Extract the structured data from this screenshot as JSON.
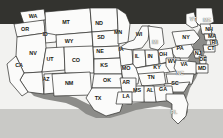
{
  "image": {
    "title": "Map of the United States with state abbreviations",
    "width": 223,
    "height": 138
  },
  "palette": {
    "sky_band": "#33332f",
    "land_fill": "#fbfbfa",
    "border_stroke": "#2b2b28",
    "ocean_shadow": "#8e8e8b",
    "foreground_band": "#c9c9c6"
  },
  "map": {
    "name": "united-states-map",
    "region_count": 49,
    "states": [
      {
        "code": "WA",
        "name": "Washington",
        "x": 33,
        "y": 17,
        "light": false
      },
      {
        "code": "OR",
        "name": "Oregon",
        "x": 25,
        "y": 30,
        "light": false
      },
      {
        "code": "ID",
        "name": "Idaho",
        "x": 45,
        "y": 35,
        "light": false
      },
      {
        "code": "MT",
        "name": "Montana",
        "x": 66,
        "y": 23,
        "light": false
      },
      {
        "code": "ND",
        "name": "North Dakota",
        "x": 99,
        "y": 24,
        "light": false
      },
      {
        "code": "SD",
        "name": "South Dakota",
        "x": 101,
        "y": 38,
        "light": false
      },
      {
        "code": "MN",
        "name": "Minnesota",
        "x": 118,
        "y": 33,
        "light": false
      },
      {
        "code": "WI",
        "name": "Wisconsin",
        "x": 139,
        "y": 35,
        "light": false
      },
      {
        "code": "WY",
        "name": "Wyoming",
        "x": 69,
        "y": 42,
        "light": false
      },
      {
        "code": "NV",
        "name": "Nevada",
        "x": 33,
        "y": 54,
        "light": false
      },
      {
        "code": "UT",
        "name": "Utah",
        "x": 50,
        "y": 60,
        "light": false
      },
      {
        "code": "CA",
        "name": "California",
        "x": 19,
        "y": 66,
        "light": false
      },
      {
        "code": "CO",
        "name": "Colorado",
        "x": 76,
        "y": 61,
        "light": false
      },
      {
        "code": "NE",
        "name": "Nebraska",
        "x": 100,
        "y": 52,
        "light": false
      },
      {
        "code": "IA",
        "name": "Iowa",
        "x": 121,
        "y": 50,
        "light": false
      },
      {
        "code": "KS",
        "name": "Kansas",
        "x": 104,
        "y": 66,
        "light": false
      },
      {
        "code": "MO",
        "name": "Missouri",
        "x": 126,
        "y": 69,
        "light": false
      },
      {
        "code": "IL",
        "name": "Illinois",
        "x": 137,
        "y": 57,
        "light": false
      },
      {
        "code": "IN",
        "name": "Indiana",
        "x": 150,
        "y": 57,
        "light": false
      },
      {
        "code": "MI",
        "name": "Michigan",
        "x": 155,
        "y": 43,
        "light": true
      },
      {
        "code": "OH",
        "name": "Ohio",
        "x": 163,
        "y": 55,
        "light": false
      },
      {
        "code": "PA",
        "name": "Pennsylvania",
        "x": 180,
        "y": 49,
        "light": false
      },
      {
        "code": "NY",
        "name": "New York",
        "x": 186,
        "y": 38,
        "light": false
      },
      {
        "code": "VT",
        "name": "Vermont",
        "x": 193,
        "y": 20,
        "light": true
      },
      {
        "code": "ME",
        "name": "Maine",
        "x": 207,
        "y": 21,
        "light": true
      },
      {
        "code": "NH",
        "name": "New Hampshire",
        "x": 209,
        "y": 30,
        "light": false
      },
      {
        "code": "MA",
        "name": "Massachusetts",
        "x": 212,
        "y": 37,
        "light": false
      },
      {
        "code": "RI",
        "name": "Rhode Island",
        "x": 214,
        "y": 43,
        "light": false
      },
      {
        "code": "CT",
        "name": "Connecticut",
        "x": 211,
        "y": 49,
        "light": false
      },
      {
        "code": "NJ",
        "name": "New Jersey",
        "x": 198,
        "y": 54,
        "light": false
      },
      {
        "code": "DE",
        "name": "Delaware",
        "x": 203,
        "y": 60,
        "light": false
      },
      {
        "code": "MD",
        "name": "Maryland",
        "x": 202,
        "y": 69,
        "light": false
      },
      {
        "code": "WV",
        "name": "West Virginia",
        "x": 172,
        "y": 62,
        "light": false
      },
      {
        "code": "VA",
        "name": "Virginia",
        "x": 184,
        "y": 65,
        "light": false
      },
      {
        "code": "KY",
        "name": "Kentucky",
        "x": 157,
        "y": 68,
        "light": false
      },
      {
        "code": "TN",
        "name": "Tennessee",
        "x": 151,
        "y": 78,
        "light": false
      },
      {
        "code": "NC",
        "name": "North Carolina",
        "x": 180,
        "y": 74,
        "light": true
      },
      {
        "code": "SC",
        "name": "South Carolina",
        "x": 175,
        "y": 84,
        "light": false
      },
      {
        "code": "GA",
        "name": "Georgia",
        "x": 163,
        "y": 90,
        "light": false
      },
      {
        "code": "AL",
        "name": "Alabama",
        "x": 150,
        "y": 91,
        "light": false
      },
      {
        "code": "MS",
        "name": "Mississippi",
        "x": 137,
        "y": 91,
        "light": false
      },
      {
        "code": "AR",
        "name": "Arkansas",
        "x": 126,
        "y": 83,
        "light": false
      },
      {
        "code": "LA",
        "name": "Louisiana",
        "x": 126,
        "y": 97,
        "light": false
      },
      {
        "code": "OK",
        "name": "Oklahoma",
        "x": 107,
        "y": 81,
        "light": false
      },
      {
        "code": "TX",
        "name": "Texas",
        "x": 98,
        "y": 99,
        "light": false
      },
      {
        "code": "NM",
        "name": "New Mexico",
        "x": 69,
        "y": 84,
        "light": false
      },
      {
        "code": "AZ",
        "name": "Arizona",
        "x": 46,
        "y": 80,
        "light": false
      },
      {
        "code": "FL",
        "name": "Florida",
        "x": 174,
        "y": 113,
        "light": true
      }
    ]
  }
}
